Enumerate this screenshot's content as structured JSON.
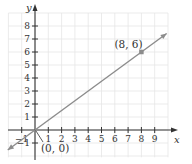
{
  "chart_data": {
    "type": "line",
    "title": "",
    "xlabel": "x",
    "ylabel": "y",
    "xlim": [
      -2,
      10
    ],
    "ylim": [
      -2,
      9
    ],
    "grid": true,
    "x_ticks": [
      -1,
      1,
      2,
      3,
      4,
      5,
      6,
      7,
      8,
      9
    ],
    "y_ticks": [
      -1,
      1,
      2,
      3,
      4,
      5,
      6,
      7,
      8
    ],
    "x_tick_labels": [
      "−1",
      "1",
      "2",
      "3",
      "4",
      "5",
      "6",
      "7",
      "8",
      "9"
    ],
    "y_tick_labels": [
      "−1",
      "1",
      "2",
      "3",
      "4",
      "5",
      "6",
      "7",
      "8"
    ],
    "series": [
      {
        "name": "line through origin",
        "equation": "y = 0.75x",
        "x": [
          -2,
          0,
          8,
          10
        ],
        "y": [
          -1.5,
          0,
          6,
          7.5
        ]
      }
    ],
    "annotations": [
      {
        "label": "(0, 0)",
        "x": 0,
        "y": 0
      },
      {
        "label": "(8, 6)",
        "x": 8,
        "y": 6
      }
    ],
    "colors": {
      "line": "#8c8c8c",
      "axes": "#333333",
      "grid": "#e4e4e4",
      "point": "#8c8c8c"
    }
  }
}
